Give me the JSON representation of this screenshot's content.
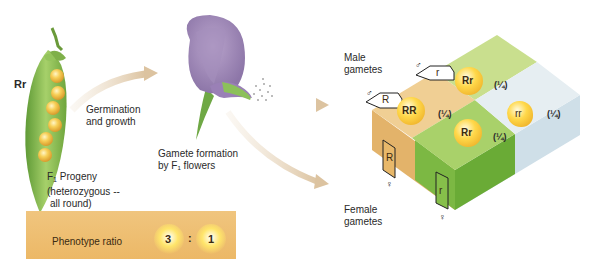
{
  "genotype_label": "Rr",
  "steps": {
    "germination": [
      "Germination",
      "and growth"
    ],
    "gamete_formation": [
      "Gamete formation",
      "by F₁ flowers"
    ]
  },
  "progeny": {
    "line1_prefix": "F",
    "line1_sub": "1",
    "line1_suffix": " Progeny",
    "line2": "(heterozygous --",
    "line3": "all round)"
  },
  "phenotype_ratio": {
    "label": "Phenotype ratio",
    "dominant": "3",
    "separator": ":",
    "recessive": "1"
  },
  "punnett": {
    "male_label": [
      "Male",
      "gametes"
    ],
    "female_label": [
      "Female",
      "gametes"
    ],
    "male_symbol": "♂",
    "female_symbol": "♀",
    "male_gametes": [
      "R",
      "r"
    ],
    "female_gametes": [
      "R",
      "r"
    ],
    "cells": [
      {
        "genotype": "RR",
        "fraction": "(¼)",
        "color": "#f0cf94"
      },
      {
        "genotype": "Rr",
        "fraction": "(¼)",
        "color": "#c9df8e"
      },
      {
        "genotype": "Rr",
        "fraction": "(¼)",
        "color": "#a9d16a"
      },
      {
        "genotype": "rr",
        "fraction": "(¼)",
        "color": "#e6eef2"
      }
    ]
  },
  "colors": {
    "arrow": "#e6d3b8",
    "pod_green": "#8cbf4f",
    "pea_yellow": "#f3c04a",
    "flower_purple": "#a48bbd",
    "ratio_box": "#eebd6d"
  }
}
